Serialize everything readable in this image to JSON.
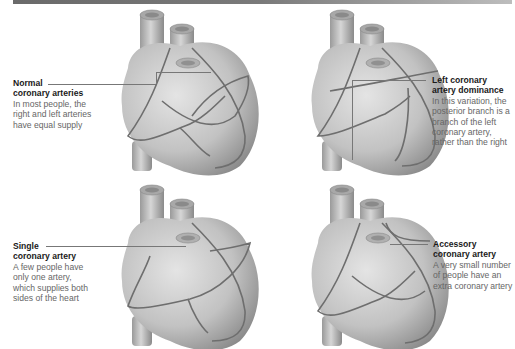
{
  "figure": {
    "panels": [
      {
        "id": "normal",
        "title_line1": "Normal",
        "title_line2": "coronary arteries",
        "description": [
          "In most people, the",
          "right and left arteries",
          "have equal supply"
        ]
      },
      {
        "id": "left-dominance",
        "title_line1": "Left coronary",
        "title_line2": "artery dominance",
        "description": [
          "In this variation, the",
          "posterior branch is a",
          "branch of the left",
          "coronary artery,",
          "rather than the right"
        ]
      },
      {
        "id": "single",
        "title_line1": "Single",
        "title_line2": "coronary artery",
        "description": [
          "A few people have",
          "only one artery,",
          "which supplies both",
          "sides of the heart"
        ]
      },
      {
        "id": "accessory",
        "title_line1": "Accessory",
        "title_line2": "coronary artery",
        "description": [
          "A very small number",
          "of people have an",
          "extra coronary artery"
        ]
      }
    ],
    "colors": {
      "heart": "#bfbfbf",
      "artery": "#6e6e6e",
      "title": "#1a1a1a",
      "text": "#666666",
      "topbar": "#707070"
    }
  }
}
